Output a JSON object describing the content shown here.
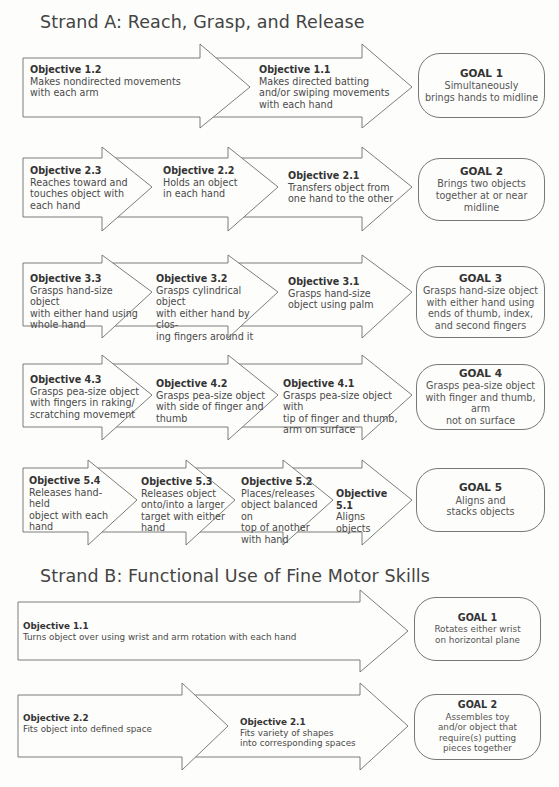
{
  "strand_a": {
    "title": "Strand A: Reach, Grasp, and Release",
    "rows": [
      {
        "objectives": [
          {
            "label": "Objective 1.2",
            "lines": [
              "Makes nondirected movements",
              "with each arm"
            ]
          },
          {
            "label": "Objective 1.1",
            "lines": [
              "Makes directed batting",
              "and/or swiping movements",
              "with each hand"
            ]
          }
        ],
        "goal": {
          "label": "GOAL 1",
          "lines": [
            "Simultaneously",
            "brings hands to midline"
          ]
        }
      },
      {
        "objectives": [
          {
            "label": "Objective 2.3",
            "lines": [
              "Reaches toward and",
              "touches object with",
              "each hand"
            ]
          },
          {
            "label": "Objective 2.2",
            "lines": [
              "Holds an object",
              "in each hand"
            ]
          },
          {
            "label": "Objective 2.1",
            "lines": [
              "Transfers object from",
              "one hand to the other"
            ]
          }
        ],
        "goal": {
          "label": "GOAL 2",
          "lines": [
            "Brings two objects",
            "together at or near midline"
          ]
        }
      },
      {
        "objectives": [
          {
            "label": "Objective 3.3",
            "lines": [
              "Grasps hand-size object",
              "with either hand using",
              "whole hand"
            ]
          },
          {
            "label": "Objective 3.2",
            "lines": [
              "Grasps cylindrical object",
              "with either hand by clos-",
              "ing fingers around it"
            ]
          },
          {
            "label": "Objective 3.1",
            "lines": [
              "Grasps hand-size",
              "object using palm"
            ]
          }
        ],
        "goal": {
          "label": "GOAL 3",
          "lines": [
            "Grasps hand-size object",
            "with either hand using",
            "ends of thumb, index,",
            "and second fingers"
          ]
        }
      },
      {
        "objectives": [
          {
            "label": "Objective 4.3",
            "lines": [
              "Grasps pea-size object",
              "with fingers in raking/",
              "scratching movement"
            ]
          },
          {
            "label": "Objective 4.2",
            "lines": [
              "Grasps pea-size object",
              "with side of finger and",
              "thumb"
            ]
          },
          {
            "label": "Objective 4.1",
            "lines": [
              "Grasps pea-size object with",
              "tip of finger and thumb,",
              "arm on surface"
            ]
          }
        ],
        "goal": {
          "label": "GOAL 4",
          "lines": [
            "Grasps pea-size object",
            "with finger and thumb, arm",
            "not on surface"
          ]
        }
      },
      {
        "objectives": [
          {
            "label": "Objective 5.4",
            "lines": [
              "Releases hand-held",
              "object with each",
              "hand"
            ]
          },
          {
            "label": "Objective 5.3",
            "lines": [
              "Releases object",
              "onto/into a larger",
              "target with either",
              "hand"
            ]
          },
          {
            "label": "Objective 5.2",
            "lines": [
              "Places/releases",
              "object balanced on",
              "top of another",
              "with hand"
            ]
          },
          {
            "label": "Objective 5.1",
            "lines": [
              "Aligns",
              "objects"
            ]
          }
        ],
        "goal": {
          "label": "GOAL 5",
          "lines": [
            "Aligns and",
            "stacks objects"
          ]
        }
      }
    ]
  },
  "strand_b": {
    "title": "Strand B: Functional Use of Fine Motor Skills",
    "rows": [
      {
        "objectives": [
          {
            "label": "Objective 1.1",
            "lines": [
              "Turns object over using wrist and arm rotation with each hand"
            ]
          }
        ],
        "goal": {
          "label": "GOAL 1",
          "lines": [
            "Rotates either wrist",
            "on horizontal plane"
          ]
        }
      },
      {
        "objectives": [
          {
            "label": "Objective 2.2",
            "lines": [
              "Fits object into defined space"
            ]
          },
          {
            "label": "Objective 2.1",
            "lines": [
              "Fits variety of shapes",
              "into corresponding spaces"
            ]
          }
        ],
        "goal": {
          "label": "GOAL 2",
          "lines": [
            "Assembles toy",
            "and/or object that",
            "require(s) putting",
            "pieces together"
          ]
        }
      }
    ]
  },
  "colors": {
    "stroke": "#6e6e6e",
    "fill": "#fdfdfb",
    "text": "#3a3a3a"
  }
}
